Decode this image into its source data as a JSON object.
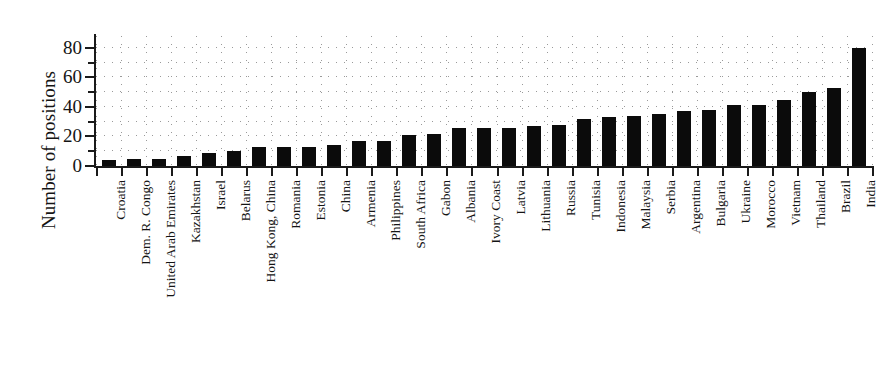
{
  "chart_data": {
    "type": "bar",
    "title": "",
    "xlabel": "",
    "ylabel": "Number of positions",
    "ylim": [
      0,
      88
    ],
    "ytick_values": [
      0,
      20,
      40,
      60,
      80
    ],
    "ytick_labels": [
      "0",
      "20",
      "40",
      "60",
      "80"
    ],
    "yminor_values": [
      10,
      30,
      50,
      70
    ],
    "grid": "dotted",
    "grid_spacing": 10,
    "legend": "none",
    "bar_color": "#0b0b0b",
    "categories": [
      "Croatia",
      "Dem. R. Congo",
      "United Arab Emirates",
      "Kazakhstan",
      "Israel",
      "Belarus",
      "Hong Kong, China",
      "Romania",
      "Estonia",
      "China",
      "Armenia",
      "Philippines",
      "South Africa",
      "Gabon",
      "Albania",
      "Ivory Coast",
      "Latvia",
      "Lithuania",
      "Russia",
      "Tunisia",
      "Indonesia",
      "Malaysia",
      "Serbia",
      "Argentina",
      "Bulgaria",
      "Ukraine",
      "Morocco",
      "Vietnam",
      "Thailand",
      "Brazil",
      "India"
    ],
    "values": [
      4,
      5,
      5,
      7,
      9,
      10,
      13,
      13,
      13,
      14,
      17,
      17,
      21,
      22,
      26,
      26,
      26,
      27,
      28,
      32,
      33,
      34,
      35,
      37,
      38,
      41,
      41,
      45,
      50,
      53,
      80
    ]
  }
}
